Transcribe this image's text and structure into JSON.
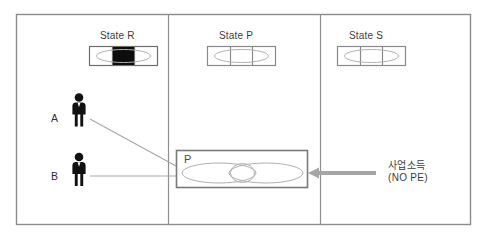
{
  "diagram": {
    "title": "",
    "colors": {
      "outer_border": "#8c8c8c",
      "divider": "#8f8f8f",
      "state_box_border": "#6e6e6e",
      "state_box_fill": "#ffffff",
      "state_filled_cell": "#0d0d0d",
      "ellipse_stroke": "#b0b0b0",
      "p_box_border": "#7a7a7a",
      "person_fill": "#111111",
      "connector_line": "#a8a8a8",
      "arrow": "#a6a6a6",
      "text": "#3b3b3b"
    },
    "panels": [
      {
        "id": "panel-left",
        "label": ""
      },
      {
        "id": "panel-middle",
        "label": ""
      },
      {
        "id": "panel-right",
        "label": ""
      }
    ],
    "states": [
      {
        "id": "state-r",
        "caption": "State R",
        "cells": 3,
        "filled_cell_index": 1
      },
      {
        "id": "state-p",
        "caption": "State P",
        "cells": 3,
        "filled_cell_index": -1
      },
      {
        "id": "state-s",
        "caption": "State S",
        "cells": 3,
        "filled_cell_index": -1
      }
    ],
    "people": [
      {
        "id": "person-a",
        "label": "A"
      },
      {
        "id": "person-b",
        "label": "B"
      }
    ],
    "p_box": {
      "label": "P",
      "ellipses": 2
    },
    "income_annotation": {
      "korean": "사업소득",
      "english": "(NO PE)"
    },
    "connectors": [
      {
        "from": "person-a",
        "to": "p-box",
        "style": "line"
      },
      {
        "from": "person-b",
        "to": "p-box",
        "style": "line"
      },
      {
        "from": "income_annotation",
        "to": "p-box",
        "style": "arrow-left"
      }
    ]
  }
}
